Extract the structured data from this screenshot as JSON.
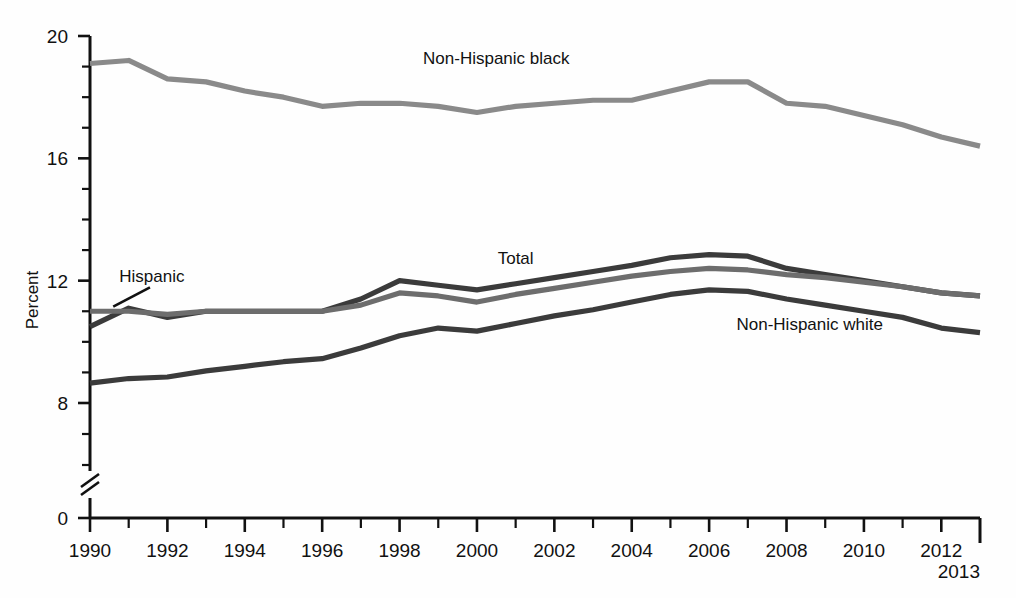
{
  "chart_data": {
    "type": "line",
    "title": "",
    "subtitle": "",
    "xlabel": "",
    "ylabel": "Percent",
    "xlim": [
      1990,
      2013
    ],
    "ylim": [
      8,
      20
    ],
    "y_axis_break": true,
    "y_axis_zero_shown": true,
    "grid": false,
    "legend_position": "inline-annotations",
    "ytick_labels": [
      "20",
      "16",
      "12",
      "8",
      "0"
    ],
    "ytick_values": [
      20,
      16,
      12,
      8,
      0
    ],
    "yminor_step": 1,
    "xtick_labels": [
      "1990",
      "1992",
      "1994",
      "1996",
      "1998",
      "2000",
      "2002",
      "2004",
      "2006",
      "2008",
      "2010",
      "2012"
    ],
    "xtick_values": [
      1990,
      1992,
      1994,
      1996,
      1998,
      2000,
      2002,
      2004,
      2006,
      2008,
      2010,
      2012
    ],
    "x_end_label": "2013",
    "x": [
      1990,
      1991,
      1992,
      1993,
      1994,
      1995,
      1996,
      1997,
      1998,
      1999,
      2000,
      2001,
      2002,
      2003,
      2004,
      2005,
      2006,
      2007,
      2008,
      2009,
      2010,
      2011,
      2012,
      2013
    ],
    "series": [
      {
        "name": "Non-Hispanic black",
        "color": "#8a8a8a",
        "label_x": 2000.5,
        "label_y": 19.1,
        "values": [
          19.1,
          19.2,
          18.6,
          18.5,
          18.2,
          18.0,
          17.7,
          17.8,
          17.8,
          17.7,
          17.5,
          17.7,
          17.8,
          17.9,
          17.9,
          18.2,
          18.5,
          18.5,
          17.8,
          17.7,
          17.4,
          17.1,
          16.7,
          16.4
        ]
      },
      {
        "name": "Hispanic",
        "color": "#3b3b3b",
        "label_x": 1991.6,
        "label_y": 11.95,
        "values": [
          10.5,
          11.1,
          10.8,
          11.0,
          11.0,
          11.0,
          11.0,
          11.4,
          12.0,
          11.85,
          11.7,
          11.9,
          12.1,
          12.3,
          12.5,
          12.75,
          12.85,
          12.8,
          12.4,
          12.2,
          12.0,
          11.8,
          11.6,
          11.5
        ]
      },
      {
        "name": "Total",
        "color": "#6d6d6d",
        "label_x": 2001.0,
        "label_y": 12.55,
        "values": [
          11.0,
          11.0,
          10.9,
          11.0,
          11.0,
          11.0,
          11.0,
          11.2,
          11.6,
          11.5,
          11.3,
          11.55,
          11.75,
          11.95,
          12.15,
          12.3,
          12.4,
          12.35,
          12.2,
          12.1,
          11.95,
          11.8,
          11.6,
          11.5
        ]
      },
      {
        "name": "Non-Hispanic white",
        "color": "#3b3b3b",
        "label_x": 2008.6,
        "label_y": 10.4,
        "values": [
          8.65,
          8.8,
          8.85,
          9.05,
          9.2,
          9.35,
          9.45,
          9.8,
          10.2,
          10.45,
          10.35,
          10.6,
          10.85,
          11.05,
          11.3,
          11.55,
          11.7,
          11.65,
          11.4,
          11.2,
          11.0,
          10.8,
          10.45,
          10.3
        ]
      }
    ],
    "annotations": [
      {
        "name": "hispanic-leader-line",
        "from_x": 1991.55,
        "from_y": 11.78,
        "to_x": 1990.6,
        "to_y": 11.15
      }
    ]
  }
}
